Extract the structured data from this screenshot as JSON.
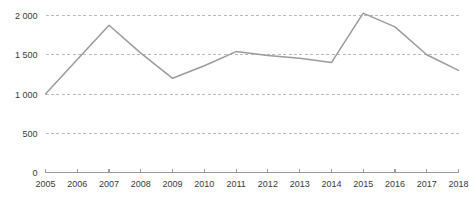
{
  "chart_data": {
    "type": "line",
    "title": "",
    "subtitle": "",
    "xlabel": "",
    "ylabel": "",
    "grid": true,
    "legend_position": "none",
    "xlim": [
      2005,
      2018
    ],
    "ylim": [
      0,
      2000
    ],
    "categories": [
      "2005",
      "2006",
      "2007",
      "2008",
      "2009",
      "2010",
      "2011",
      "2012",
      "2013",
      "2014",
      "2015",
      "2016",
      "2017",
      "2018"
    ],
    "x": [
      2005,
      2006,
      2007,
      2008,
      2009,
      2010,
      2011,
      2012,
      2013,
      2014,
      2015,
      2016,
      2017,
      2018
    ],
    "values": [
      1000,
      1440,
      1875,
      1520,
      1200,
      1360,
      1540,
      1490,
      1455,
      1400,
      2030,
      1855,
      1500,
      1300
    ],
    "series": [
      {
        "name": "",
        "color": "#9b9b9b",
        "values": [
          1000,
          1440,
          1875,
          1520,
          1200,
          1360,
          1540,
          1490,
          1455,
          1400,
          2030,
          1855,
          1500,
          1300
        ]
      }
    ],
    "x_tick_labels": [
      "2005",
      "2006",
      "2007",
      "2008",
      "2009",
      "2010",
      "2011",
      "2012",
      "2013",
      "2014",
      "2015",
      "2016",
      "2017",
      "2018"
    ],
    "y_tick_values": [
      0,
      500,
      1000,
      1500,
      2000
    ],
    "y_tick_labels": [
      "0",
      "500",
      "1 000",
      "1 500",
      "2 000"
    ],
    "colors": {
      "line": "#9b9b9b",
      "grid": "#b9b9b9",
      "axis": "#9a9a9a",
      "text": "#3a3a3a",
      "background": "#ffffff"
    }
  }
}
